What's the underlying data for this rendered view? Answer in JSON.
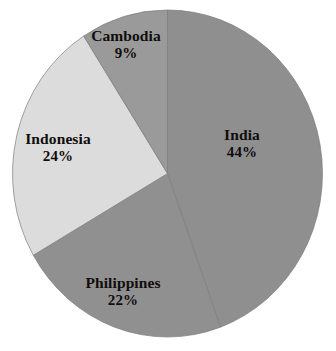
{
  "chart_data": {
    "type": "pie",
    "title": "",
    "subtitle": "",
    "xlabel": "",
    "ylabel": "",
    "grid": false,
    "legend": "none",
    "labels_inside": true,
    "start_angle_deg": 0,
    "direction": "clockwise",
    "categories": [
      "India",
      "Philippines",
      "Indonesia",
      "Cambodia"
    ],
    "values": [
      44,
      22,
      24,
      9
    ],
    "unit": "%",
    "slices": [
      {
        "name": "India",
        "value": 44,
        "value_label": "44%",
        "color": "#8f8f8f",
        "start_deg": 0,
        "end_deg": 162.4
      },
      {
        "name": "Philippines",
        "value": 22,
        "value_label": "22%",
        "color": "#909090",
        "start_deg": 162.4,
        "end_deg": 243.6
      },
      {
        "name": "Indonesia",
        "value": 24,
        "value_label": "24%",
        "color": "#dcdcdc",
        "start_deg": 243.6,
        "end_deg": 332.2
      },
      {
        "name": "Cambodia",
        "value": 9,
        "value_label": "9%",
        "color": "#9a9a9a",
        "start_deg": 332.2,
        "end_deg": 360
      }
    ]
  },
  "labels": {
    "india": {
      "name": "India",
      "value": "44%"
    },
    "indonesia": {
      "name": "Indonesia",
      "value": "24%"
    },
    "philippines": {
      "name": "Philippines",
      "value": "22%"
    },
    "cambodia": {
      "name": "Cambodia",
      "value": "9%"
    }
  },
  "colors": {
    "background": "#ffffff",
    "text": "#100d0c",
    "india": "#8f8f8f",
    "philippines": "#909090",
    "indonesia": "#dcdcdc",
    "cambodia": "#9a9a9a",
    "slice_edge": "#7d7d7d"
  }
}
